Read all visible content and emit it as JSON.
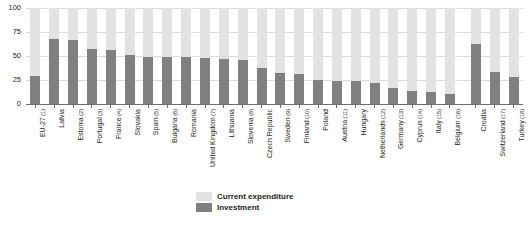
{
  "chart_data": {
    "type": "bar",
    "subtype": "stacked-100-percent",
    "title": "",
    "xlabel": "",
    "ylabel": "",
    "ylim": [
      0,
      100
    ],
    "yticks": [
      0,
      25,
      50,
      75,
      100
    ],
    "ytick_labels": [
      "0",
      "25",
      "50",
      "75",
      "100"
    ],
    "grid": true,
    "legend_position": "bottom-center",
    "categories": [
      "EU-27",
      "Latvia",
      "Estonia",
      "Portugal",
      "France",
      "Slovakia",
      "Spain",
      "Bulgaria",
      "Romania",
      "United Kingdom",
      "Lithuania",
      "Slovenia",
      "Czech Republic",
      "Sweden",
      "Finland",
      "Poland",
      "Austria",
      "Hungary",
      "Netherlands",
      "Germany",
      "Cyprus",
      "Italy",
      "Belgium",
      "Croatia",
      "Switzerland",
      "Turkey"
    ],
    "category_footnotes": [
      "(1)",
      "",
      "(2)",
      "(3)",
      "(4)",
      "",
      "(5)",
      "(6)",
      "",
      "(7)",
      "",
      "(8)",
      "",
      "(9)",
      "(10)",
      "",
      "(11)",
      "",
      "(12)",
      "(13)",
      "(14)",
      "(15)",
      "(16)",
      "",
      "(17)",
      "(18)"
    ],
    "group_break_before_index": 23,
    "series": [
      {
        "name": "Investment",
        "color": "#808080",
        "values": [
          29,
          68,
          67,
          57,
          56,
          51,
          49,
          49,
          49,
          48,
          47,
          46,
          37,
          32,
          31,
          25,
          24,
          24,
          22,
          17,
          14,
          13,
          10,
          63,
          33,
          28
        ]
      },
      {
        "name": "Current expenditure",
        "color": "#e2e2e2",
        "values": [
          71,
          32,
          33,
          43,
          44,
          49,
          51,
          51,
          51,
          52,
          53,
          54,
          63,
          68,
          69,
          75,
          76,
          76,
          78,
          83,
          86,
          87,
          90,
          37,
          67,
          72
        ]
      }
    ]
  },
  "legend": {
    "items": [
      {
        "label": "Current expenditure",
        "color": "#e2e2e2"
      },
      {
        "label": "Investment",
        "color": "#808080"
      }
    ]
  }
}
